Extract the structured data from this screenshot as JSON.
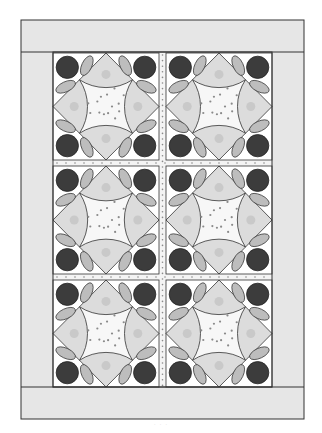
{
  "figure": {
    "type": "quilt-layout-diagram",
    "grid": {
      "rows": 3,
      "cols": 2
    },
    "block_pattern": "circle-and-melon block with corner circles and leaves",
    "caption": "· · ·"
  },
  "colors": {
    "background": "#ffffff",
    "border_fill": "#e6e6e6",
    "outline": "#333333",
    "circle": "#3c3c3c",
    "leaf": "#bdbdbd",
    "melon": "#dcdcdc",
    "melon_print": "#c4c4c4",
    "center_bg": "#f7f7f7",
    "center_dot": "#8a8a8a",
    "sashing_bg": "#f4f4f4"
  },
  "layout": {
    "outer": {
      "x": 21,
      "y": 20,
      "w": 283,
      "h": 399
    },
    "border_width": 32,
    "sashing": 6,
    "blocks": [
      {
        "row": 0,
        "col": 0,
        "x": 53,
        "y": 53,
        "w": 106,
        "h": 107
      },
      {
        "row": 0,
        "col": 1,
        "x": 166,
        "y": 53,
        "w": 106,
        "h": 107
      },
      {
        "row": 1,
        "col": 0,
        "x": 53,
        "y": 166,
        "w": 106,
        "h": 108
      },
      {
        "row": 1,
        "col": 1,
        "x": 166,
        "y": 166,
        "w": 106,
        "h": 108
      },
      {
        "row": 2,
        "col": 0,
        "x": 53,
        "y": 280,
        "w": 106,
        "h": 107
      },
      {
        "row": 2,
        "col": 1,
        "x": 166,
        "y": 280,
        "w": 106,
        "h": 107
      }
    ]
  }
}
